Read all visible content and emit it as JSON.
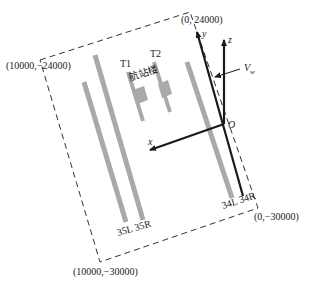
{
  "diagram": {
    "colors": {
      "runway": "#a9a9a9",
      "terminal": "#a9a9a9",
      "axis": "#1a1a1a",
      "boundary": "#333333",
      "text": "#222222"
    },
    "corners": {
      "top_left": "(10000,−24000)",
      "top_right": "(0, 24000)",
      "bottom_right": "(0,−30000)",
      "bottom_left": "(10000,−30000)"
    },
    "terminals": {
      "t1": "T1",
      "t2": "T2",
      "building": "航站楼"
    },
    "runways": {
      "west_pair": "35L 35R",
      "east_pair": "34L 34R"
    },
    "axes": {
      "x": "x",
      "y": "y",
      "z": "z",
      "origin": "O",
      "wind": "V",
      "wind_sub": "w"
    }
  }
}
